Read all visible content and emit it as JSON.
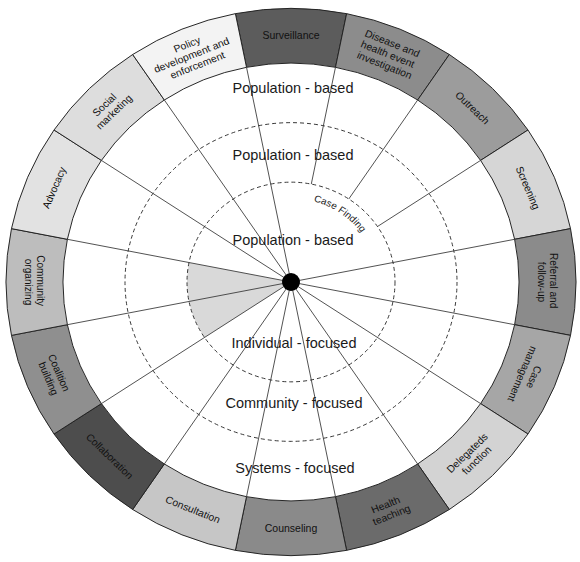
{
  "wheel": {
    "levels": {
      "population_based_outer": "Population - based",
      "population_based_middle": "Population - based",
      "population_based_inner": "Population - based",
      "individual_focused": "Individual - focused",
      "community_focused": "Community - focused",
      "systems_focused": "Systems - focused"
    },
    "case_finding_label": "Case Finding",
    "interventions": [
      {
        "lines": [
          "Surveillance"
        ],
        "color": "#5c5c5c"
      },
      {
        "lines": [
          "Disease and",
          "health event",
          "investigation"
        ],
        "color": "#8c8c8c"
      },
      {
        "lines": [
          "Outreach"
        ],
        "color": "#9c9c9c"
      },
      {
        "lines": [
          "Screening"
        ],
        "color": "#d6d6d6"
      },
      {
        "lines": [
          "Referral and",
          "follow-up"
        ],
        "color": "#8b8b8b"
      },
      {
        "lines": [
          "Case",
          "management"
        ],
        "color": "#a6a6a6"
      },
      {
        "lines": [
          "Delegateds",
          "function"
        ],
        "color": "#d3d3d3"
      },
      {
        "lines": [
          "Health",
          "teaching"
        ],
        "color": "#6b6b6b"
      },
      {
        "lines": [
          "Counseling"
        ],
        "color": "#8a8a8a"
      },
      {
        "lines": [
          "Consultation"
        ],
        "color": "#c6c6c6"
      },
      {
        "lines": [
          "Collaboration"
        ],
        "color": "#4d4d4d"
      },
      {
        "lines": [
          "Coalition",
          "building"
        ],
        "color": "#8f8f8f"
      },
      {
        "lines": [
          "Community",
          "organizing"
        ],
        "color": "#bdbdbd"
      },
      {
        "lines": [
          "Advocacy"
        ],
        "color": "#e2e2e2"
      },
      {
        "lines": [
          "Social",
          "marketing"
        ],
        "color": "#dddddd"
      },
      {
        "lines": [
          "Policy",
          "development and",
          "enforcement"
        ],
        "color": "#f3f3f3"
      }
    ],
    "colors": {
      "ring_border": "#222222",
      "spoke": "#3a3a3a",
      "dashed_circle": "#333333",
      "highlight_wedge": "#d9d9d9",
      "hub": "#000000"
    }
  }
}
